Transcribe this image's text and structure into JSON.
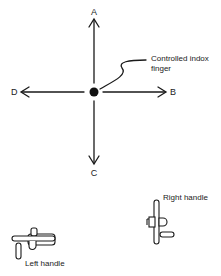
{
  "diagram": {
    "directions": {
      "up": "A",
      "right": "B",
      "down": "C",
      "left": "D"
    },
    "center_label_line1": "Controlled indox",
    "center_label_line2": "finger",
    "right_handle_label": "Right handle",
    "left_handle_label": "Left handle",
    "ink_color": "#1a1a1a"
  }
}
